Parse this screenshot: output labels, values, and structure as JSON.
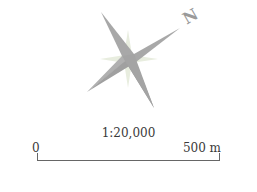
{
  "compass": {
    "north_label": "N",
    "colors": {
      "main_points": "#a9a9a9",
      "secondary_points": "#e3ead8",
      "label": "#9a9a9a"
    }
  },
  "scale": {
    "ratio": "1:20,000",
    "start_label": "0",
    "end_label": "500 m"
  }
}
